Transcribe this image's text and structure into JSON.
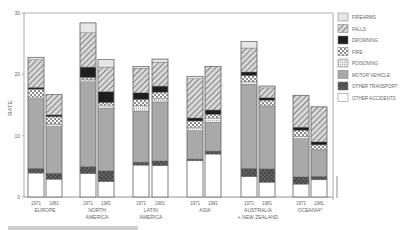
{
  "chart_data": {
    "type": "bar",
    "stacked": true,
    "title": "",
    "xlabel": "",
    "ylabel": "RATE",
    "ylim": [
      0,
      30
    ],
    "yticks": [
      0,
      10,
      20,
      30
    ],
    "grid": false,
    "legend_position": "right",
    "groups": [
      "EUROPE",
      "NORTH\nAMERICA",
      "LATIN\nAMERICA",
      "ASIA",
      "AUSTRALIA\n+ NEW ZEALAND",
      "OCEANIA*"
    ],
    "group_labels": [
      [
        "EUROPE"
      ],
      [
        "NORTH",
        "AMERICA"
      ],
      [
        "LATIN",
        "AMERICA"
      ],
      [
        "ASIA"
      ],
      [
        "AUSTRALIA",
        "+ NEW ZEALAND"
      ],
      [
        "OCEANIA*"
      ]
    ],
    "years": [
      "1971",
      "1981"
    ],
    "series_order_bottom_to_top": [
      "OTHER ACCIDENTS",
      "OTHER TRANSPORT",
      "MOTOR VEHICLE",
      "POISONING",
      "FIRE",
      "DROWNING",
      "FALLS",
      "FIREARMS"
    ],
    "legend": [
      "FIREARMS",
      "FALLS",
      "DROWNING",
      "FIRE",
      "POISONING",
      "MOTOR VEHICLE",
      "OTHER TRANSPORT",
      "OTHER ACCIDENTS"
    ],
    "bars": [
      {
        "group": "EUROPE",
        "year": "1971",
        "values": {
          "OTHER ACCIDENTS": 3.9,
          "OTHER TRANSPORT": 0.8,
          "MOTOR VEHICLE": 11.3,
          "POISONING": 0.3,
          "FIRE": 1.3,
          "DROWNING": 0.3,
          "FALLS": 4.5,
          "FIREARMS": 0.4
        },
        "total": 22.8
      },
      {
        "group": "EUROPE",
        "year": "1981",
        "values": {
          "OTHER ACCIDENTS": 2.9,
          "OTHER TRANSPORT": 1.0,
          "MOTOR VEHICLE": 7.6,
          "POISONING": 0.4,
          "FIRE": 1.2,
          "DROWNING": 0.3,
          "FALLS": 3.3,
          "FIREARMS": 0.0
        },
        "total": 16.7
      },
      {
        "group": "NORTH AMERICA",
        "year": "1971",
        "values": {
          "OTHER ACCIDENTS": 3.8,
          "OTHER TRANSPORT": 1.2,
          "MOTOR VEHICLE": 13.8,
          "POISONING": 0.4,
          "FIRE": 0.3,
          "DROWNING": 1.7,
          "FALLS": 5.6,
          "FIREARMS": 1.6
        },
        "total": 28.4
      },
      {
        "group": "NORTH AMERICA",
        "year": "1981",
        "values": {
          "OTHER ACCIDENTS": 2.5,
          "OTHER TRANSPORT": 1.8,
          "MOTOR VEHICLE": 10.2,
          "POISONING": 0.5,
          "FIRE": 0.4,
          "DROWNING": 1.8,
          "FALLS": 4.0,
          "FIREARMS": 1.2
        },
        "total": 22.4
      },
      {
        "group": "LATIN AMERICA",
        "year": "1971",
        "values": {
          "OTHER ACCIDENTS": 5.2,
          "OTHER TRANSPORT": 0.5,
          "MOTOR VEHICLE": 8.3,
          "POISONING": 0.9,
          "FIRE": 1.0,
          "DROWNING": 1.1,
          "FALLS": 4.0,
          "FIREARMS": 0.3
        },
        "total": 21.3
      },
      {
        "group": "LATIN AMERICA",
        "year": "1981",
        "values": {
          "OTHER ACCIDENTS": 5.1,
          "OTHER TRANSPORT": 0.8,
          "MOTOR VEHICLE": 9.6,
          "POISONING": 0.5,
          "FIRE": 1.1,
          "DROWNING": 1.0,
          "FALLS": 3.9,
          "FIREARMS": 0.5
        },
        "total": 22.5
      },
      {
        "group": "ASIA",
        "year": "1971",
        "values": {
          "OTHER ACCIDENTS": 5.9,
          "OTHER TRANSPORT": 0.3,
          "MOTOR VEHICLE": 4.6,
          "POISONING": 0.6,
          "FIRE": 1.0,
          "DROWNING": 0.5,
          "FALLS": 6.4,
          "FIREARMS": 0.4
        },
        "total": 19.7
      },
      {
        "group": "ASIA",
        "year": "1981",
        "values": {
          "OTHER ACCIDENTS": 7.0,
          "OTHER TRANSPORT": 0.5,
          "MOTOR VEHICLE": 4.7,
          "POISONING": 0.7,
          "FIRE": 0.6,
          "DROWNING": 0.7,
          "FALLS": 7.1,
          "FIREARMS": 0.0
        },
        "total": 21.3
      },
      {
        "group": "AUSTRALIA + NEW ZEALAND",
        "year": "1971",
        "values": {
          "OTHER ACCIDENTS": 3.3,
          "OTHER TRANSPORT": 1.4,
          "MOTOR VEHICLE": 13.7,
          "POISONING": 0.4,
          "FIRE": 1.0,
          "DROWNING": 0.6,
          "FALLS": 3.9,
          "FIREARMS": 1.1
        },
        "total": 25.4
      },
      {
        "group": "AUSTRALIA + NEW ZEALAND",
        "year": "1981",
        "values": {
          "OTHER ACCIDENTS": 2.4,
          "OTHER TRANSPORT": 2.2,
          "MOTOR VEHICLE": 10.2,
          "POISONING": 0.2,
          "FIRE": 0.8,
          "DROWNING": 0.4,
          "FALLS": 1.6,
          "FIREARMS": 0.3
        },
        "total": 18.1
      },
      {
        "group": "OCEANIA*",
        "year": "1971",
        "values": {
          "OTHER ACCIDENTS": 2.1,
          "OTHER TRANSPORT": 1.2,
          "MOTOR VEHICLE": 6.2,
          "POISONING": 0.4,
          "FIRE": 1.0,
          "DROWNING": 0.5,
          "FALLS": 5.2,
          "FIREARMS": 0.0
        },
        "total": 16.6
      },
      {
        "group": "OCEANIA*",
        "year": "1981",
        "values": {
          "OTHER ACCIDENTS": 2.8,
          "OTHER TRANSPORT": 0.6,
          "MOTOR VEHICLE": 4.2,
          "POISONING": 0.2,
          "FIRE": 0.7,
          "DROWNING": 0.5,
          "FALLS": 5.7,
          "FIREARMS": 0.0
        },
        "total": 14.7
      }
    ]
  },
  "styles": {
    "FIREARMS": {
      "fill": "#e6e6e6",
      "pattern": "solid"
    },
    "FALLS": {
      "fill": "#cfcfcf",
      "pattern": "diag"
    },
    "DROWNING": {
      "fill": "#1e1e1e",
      "pattern": "solid"
    },
    "FIRE": {
      "fill": "#ffffff",
      "pattern": "dots"
    },
    "POISONING": {
      "fill": "#e2e2e2",
      "pattern": "fine"
    },
    "MOTOR VEHICLE": {
      "fill": "#a9a9a9",
      "pattern": "solid"
    },
    "OTHER TRANSPORT": {
      "fill": "#5a5a5a",
      "pattern": "cross"
    },
    "OTHER ACCIDENTS": {
      "fill": "#ffffff",
      "pattern": "solid"
    }
  },
  "axis": {
    "ylabel": "RATE",
    "ticks": [
      "0",
      "10",
      "20",
      "30"
    ]
  },
  "footnote": "* ..."
}
